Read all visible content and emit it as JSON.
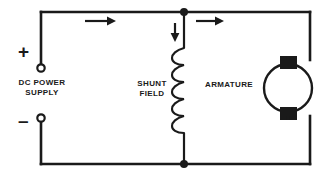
{
  "diagram": {
    "background_color": "#ffffff",
    "line_color": "#1a1a1a",
    "labels": {
      "dc_power_supply": "DC POWER\nSUPPLY",
      "shunt_field": "SHUNT\nFIELD",
      "armature": "ARMATURE",
      "positive_terminal_sign": "+",
      "negative_terminal_sign": "–"
    },
    "components": {
      "dc_power_supply": {
        "name": "dc-power-supply",
        "positive_terminal": {
          "x": 41,
          "y": 68
        },
        "negative_terminal": {
          "x": 41,
          "y": 118
        },
        "terminal_style": "open-circle"
      },
      "shunt_field": {
        "name": "shunt-field-coil",
        "x": 184,
        "y_top": 48,
        "y_bottom": 133,
        "loops": 5,
        "orientation": "vertical"
      },
      "armature": {
        "name": "armature",
        "center_x": 288,
        "center_y": 88,
        "radius": 24,
        "brushes": 2,
        "brush_color": "#1a1a1a"
      }
    },
    "wiring": {
      "loop_left": 41,
      "loop_right": 310,
      "loop_top": 12,
      "loop_bottom": 164,
      "junction_nodes": [
        {
          "name": "top-junction-node",
          "x": 184,
          "y": 12
        },
        {
          "name": "bottom-junction-node",
          "x": 184,
          "y": 164
        }
      ]
    },
    "current_arrows": [
      {
        "name": "supply-current-arrow",
        "direction": "right",
        "x": 85,
        "y": 21
      },
      {
        "name": "armature-current-arrow",
        "direction": "right",
        "x": 196,
        "y": 21
      },
      {
        "name": "field-current-arrow",
        "direction": "down",
        "x": 175,
        "y": 23
      }
    ]
  }
}
